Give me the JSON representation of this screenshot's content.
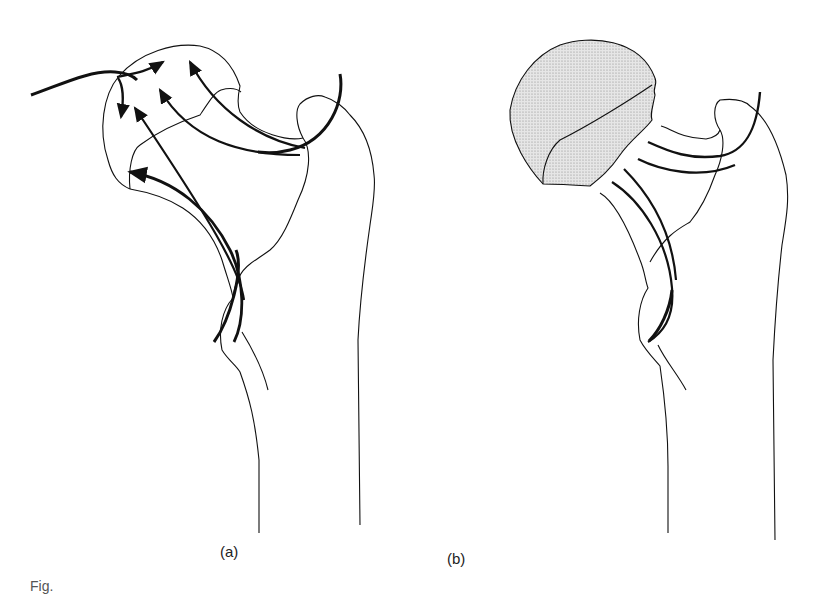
{
  "figure": {
    "panels": [
      {
        "label": "(a)",
        "description": "Proximal femur with trabecular stress lines; arrows indicate force directions into the femoral head"
      },
      {
        "label": "(b)",
        "description": "Proximal femur with femoral head (stippled) separated by a fracture across the neck"
      }
    ],
    "caption_partial": "Fig."
  },
  "colors": {
    "line": "#111111",
    "stipple": "#cfcfcf"
  }
}
